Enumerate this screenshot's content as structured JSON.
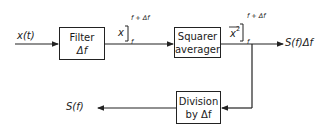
{
  "diagram": {
    "input_label": "x(t)",
    "filter": {
      "line1": "Filter",
      "line2": "Δf"
    },
    "filter_output": {
      "var": "x",
      "upper": "f + Δf",
      "lower": "f"
    },
    "squarer": {
      "line1": "Squarer",
      "line2": "averager"
    },
    "squarer_output": {
      "var": "x",
      "exp": "2",
      "upper": "f + Δf",
      "lower": "f"
    },
    "output_label": "S(f)Δf",
    "division": {
      "line1": "Division",
      "line2": "by Δf"
    },
    "final_label": "S(f)"
  }
}
